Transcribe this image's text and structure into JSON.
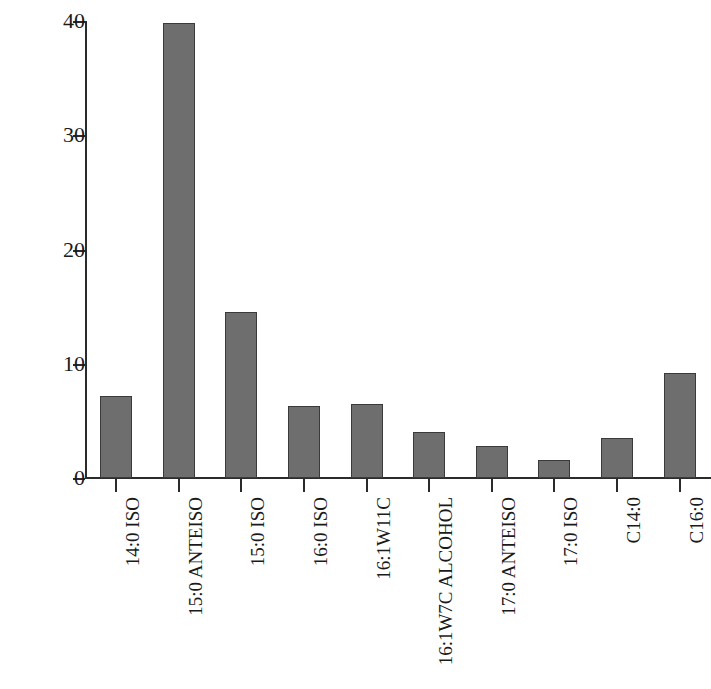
{
  "chart_data": {
    "type": "bar",
    "title": "",
    "xlabel": "",
    "ylabel": "脂肪酸含量/%",
    "ylim": [
      0,
      40
    ],
    "yticks": [
      0,
      10,
      20,
      30,
      40
    ],
    "grid": false,
    "legend": null,
    "bar_color": "#6e6e6e",
    "bar_edge_color": "#3a3a3a",
    "categories": [
      "14:0 ISO",
      "15:0 ANTEISO",
      "15:0 ISO",
      "16:0 ISO",
      "16:1W11C",
      "16:1W7C ALCOHOL",
      "17:0 ANTEISO",
      "17:0 ISO",
      "C14:0",
      "C16:0"
    ],
    "values": [
      7.2,
      39.8,
      14.5,
      6.3,
      6.5,
      4.0,
      2.8,
      1.6,
      3.5,
      9.2
    ]
  }
}
